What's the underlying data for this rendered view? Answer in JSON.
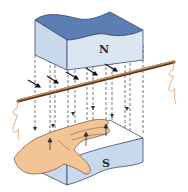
{
  "diagram": {
    "labels": {
      "north_pole": "N",
      "south_pole": "S"
    },
    "elements": [
      {
        "name": "north-magnet",
        "description": "Upper magnet block (north pole face down)"
      },
      {
        "name": "south-magnet",
        "description": "Lower magnet block (south pole)"
      },
      {
        "name": "magnetic-field-lines",
        "description": "Dashed vertical lines with downward arrows from N to S"
      },
      {
        "name": "conductor-wire",
        "description": "Straight copper wire passing diagonally between the poles, with coiled leads at both ends"
      },
      {
        "name": "force-arrows",
        "description": "Short black arrows pointing diagonally along the wire direction"
      },
      {
        "name": "left-hand",
        "description": "Flat open hand with palm facing up toward N, fingers along wire, thumb out"
      }
    ],
    "colors": {
      "magnet_top": "#5b7fb5",
      "magnet_side": "#c9d9ec",
      "magnet_front": "#dbe6f3",
      "magnet_edge": "#3a4a6a",
      "wire": "#c8935a",
      "wire_dark": "#5a3a20",
      "lead": "#e8a070",
      "hand": "#f3c596",
      "hand_outline": "#7a4a2a",
      "field_line": "#555555"
    }
  }
}
